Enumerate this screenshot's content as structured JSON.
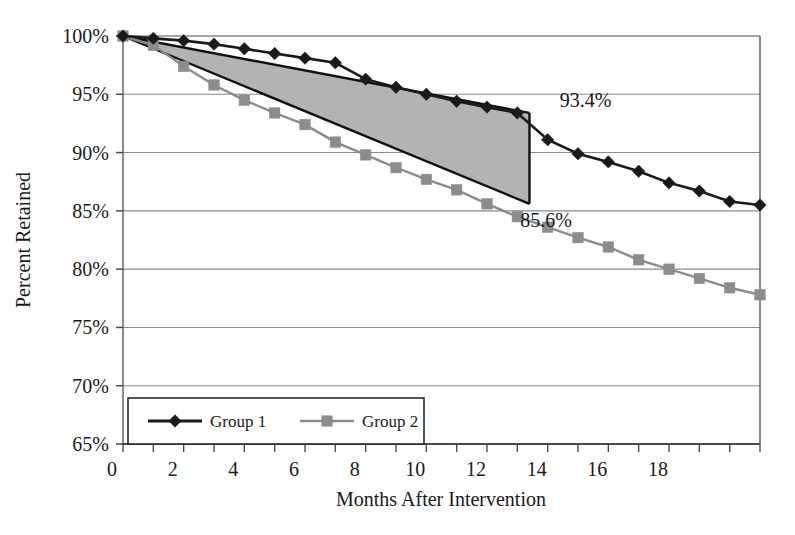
{
  "chart_data": {
    "type": "line",
    "title": "",
    "xlabel": "Months After Intervention",
    "ylabel": "Percent Retained",
    "xlim": [
      0,
      21
    ],
    "ylim": [
      65,
      100
    ],
    "xticks": [
      0,
      2,
      4,
      6,
      8,
      10,
      12,
      14,
      16,
      18
    ],
    "xticklabels": [
      "0",
      "2",
      "4",
      "6",
      "8",
      "10",
      "12",
      "14",
      "16",
      "18"
    ],
    "yticks": [
      65,
      70,
      75,
      80,
      85,
      90,
      95,
      100
    ],
    "yticklabels": [
      "65%",
      "70%",
      "75%",
      "80%",
      "85%",
      "90%",
      "95%",
      "100%"
    ],
    "grid": "horizontal",
    "legend_position": "bottom-left-inside",
    "x": [
      0,
      1,
      2,
      3,
      4,
      5,
      6,
      7,
      8,
      9,
      10,
      11,
      12,
      13,
      14,
      15,
      16,
      17,
      18,
      19,
      20,
      21
    ],
    "series": [
      {
        "name": "Group 1",
        "marker": "diamond",
        "color": "#1a1a1a",
        "values": [
          100.0,
          99.8,
          99.6,
          99.3,
          98.9,
          98.5,
          98.1,
          97.7,
          96.3,
          95.6,
          95.0,
          94.4,
          93.9,
          93.4,
          91.1,
          89.9,
          89.2,
          88.4,
          87.4,
          86.7,
          85.8,
          85.5
        ]
      },
      {
        "name": "Group 2",
        "marker": "square",
        "color": "#8c8c8c",
        "values": [
          100.0,
          99.2,
          97.4,
          95.8,
          94.5,
          93.4,
          92.4,
          90.9,
          89.8,
          88.7,
          87.7,
          86.8,
          85.6,
          84.5,
          83.6,
          82.7,
          81.9,
          80.8,
          80.0,
          79.2,
          78.4,
          77.8
        ]
      }
    ],
    "shaded_region": {
      "name": "retention-gap-wedge",
      "fill": "#b3b3b3",
      "start_month": 0,
      "end_month": 13.4,
      "upper_start": 100.0,
      "upper_end": 93.4,
      "lower_start": 100.0,
      "lower_end": 85.6
    },
    "annotations": [
      {
        "id": "upper-endpoint",
        "text": "93.4%",
        "x_month": 14.4,
        "y_value": 93.9
      },
      {
        "id": "lower-endpoint",
        "text": "85.6%",
        "x_month": 13.1,
        "y_value": 83.6
      }
    ]
  },
  "legend": {
    "items": [
      {
        "label": "Group 1",
        "marker": "diamond",
        "color": "#1a1a1a"
      },
      {
        "label": "Group 2",
        "marker": "square",
        "color": "#8c8c8c"
      }
    ]
  },
  "colors": {
    "group1": "#1a1a1a",
    "group2": "#8c8c8c",
    "wedge_fill": "#b3b3b3",
    "grid": "#8a8a8a",
    "axis": "#5a5a5a",
    "background": "#ffffff"
  }
}
